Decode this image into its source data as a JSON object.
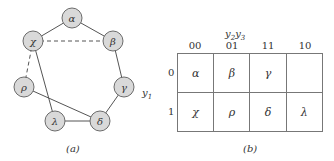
{
  "figure_a": {
    "caption": "(a)",
    "nodes": [
      {
        "id": "alpha",
        "label": "α",
        "x": 72,
        "y": 18
      },
      {
        "id": "chi",
        "label": "χ",
        "x": 33,
        "y": 41
      },
      {
        "id": "beta",
        "label": "β",
        "x": 113,
        "y": 41
      },
      {
        "id": "rho",
        "label": "ρ",
        "x": 24,
        "y": 87
      },
      {
        "id": "gamma",
        "label": "γ",
        "x": 124,
        "y": 87
      },
      {
        "id": "lambda",
        "label": "λ",
        "x": 55,
        "y": 121
      },
      {
        "id": "delta",
        "label": "δ",
        "x": 100,
        "y": 121
      }
    ],
    "edges": [
      {
        "from": "alpha",
        "to": "chi",
        "style": "solid"
      },
      {
        "from": "alpha",
        "to": "beta",
        "style": "solid"
      },
      {
        "from": "chi",
        "to": "beta",
        "style": "dashed"
      },
      {
        "from": "chi",
        "to": "rho",
        "style": "dashed"
      },
      {
        "from": "chi",
        "to": "lambda",
        "style": "solid"
      },
      {
        "from": "beta",
        "to": "gamma",
        "style": "solid"
      },
      {
        "from": "gamma",
        "to": "delta",
        "style": "solid"
      },
      {
        "from": "rho",
        "to": "delta",
        "style": "solid"
      },
      {
        "from": "lambda",
        "to": "delta",
        "style": "solid"
      }
    ]
  },
  "figure_b": {
    "caption": "(b)",
    "column_variable": "y2y3",
    "row_variable": "y1",
    "column_headers": [
      "00",
      "01",
      "11",
      "10"
    ],
    "row_headers": [
      "0",
      "1"
    ],
    "cells": [
      [
        "α",
        "β",
        "γ",
        ""
      ],
      [
        "χ",
        "ρ",
        "δ",
        "λ"
      ]
    ]
  },
  "colors": {
    "node_fill": "#d9d9d9",
    "node_stroke": "#6b6b6b",
    "line": "#555555"
  }
}
